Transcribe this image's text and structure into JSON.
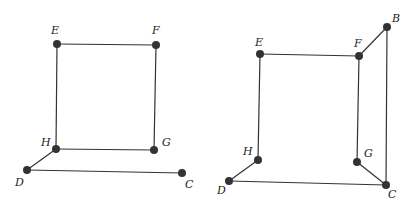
{
  "diagrams": [
    {
      "name": "left-figure",
      "points": [
        {
          "label": "E",
          "x": 57,
          "y": 44,
          "lx": 51,
          "ly": 34
        },
        {
          "label": "F",
          "x": 156,
          "y": 45,
          "lx": 152,
          "ly": 34
        },
        {
          "label": "H",
          "x": 56,
          "y": 149,
          "lx": 41,
          "ly": 146
        },
        {
          "label": "G",
          "x": 154,
          "y": 150,
          "lx": 162,
          "ly": 146
        },
        {
          "label": "D",
          "x": 27,
          "y": 170,
          "lx": 15,
          "ly": 186
        },
        {
          "label": "C",
          "x": 182,
          "y": 173,
          "lx": 185,
          "ly": 188
        }
      ],
      "edges": [
        [
          "E",
          "F"
        ],
        [
          "E",
          "H"
        ],
        [
          "F",
          "G"
        ],
        [
          "H",
          "G"
        ],
        [
          "H",
          "D"
        ],
        [
          "D",
          "C"
        ]
      ]
    },
    {
      "name": "right-figure",
      "points": [
        {
          "label": "B",
          "x": 387,
          "y": 27,
          "lx": 392,
          "ly": 22
        },
        {
          "label": "E",
          "x": 260,
          "y": 54,
          "lx": 255,
          "ly": 46
        },
        {
          "label": "F",
          "x": 359,
          "y": 56,
          "lx": 354,
          "ly": 47
        },
        {
          "label": "H",
          "x": 258,
          "y": 160,
          "lx": 243,
          "ly": 155
        },
        {
          "label": "G",
          "x": 357,
          "y": 162,
          "lx": 364,
          "ly": 157
        },
        {
          "label": "D",
          "x": 229,
          "y": 181,
          "lx": 217,
          "ly": 194
        },
        {
          "label": "C",
          "x": 386,
          "y": 185,
          "lx": 388,
          "ly": 198
        }
      ],
      "edges": [
        [
          "E",
          "F"
        ],
        [
          "F",
          "B"
        ],
        [
          "B",
          "C"
        ],
        [
          "E",
          "H"
        ],
        [
          "F",
          "G"
        ],
        [
          "G",
          "C"
        ],
        [
          "H",
          "D"
        ],
        [
          "D",
          "C"
        ]
      ]
    }
  ]
}
